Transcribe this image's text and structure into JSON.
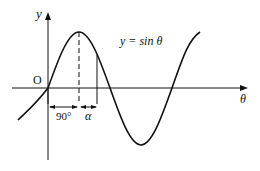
{
  "diagram": {
    "curve_label": "y = sin θ",
    "y_axis_label": "y",
    "x_axis_label": "θ",
    "origin_label": "O",
    "interval_1_label": "90°",
    "interval_2_label": "α",
    "colors": {
      "line": "#111111",
      "background": "#ffffff"
    }
  }
}
